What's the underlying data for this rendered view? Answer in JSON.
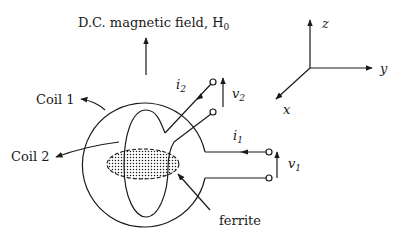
{
  "diagram": {
    "field_label": "D.C. magnetic field, H",
    "field_subscript": "0",
    "coil1_label": "Coil 1",
    "coil2_label": "Coil 2",
    "ferrite_label": "ferrite",
    "currents": {
      "i1": {
        "symbol": "i",
        "sub": "1"
      },
      "i2": {
        "symbol": "i",
        "sub": "2"
      }
    },
    "voltages": {
      "v1": {
        "symbol": "v",
        "sub": "1"
      },
      "v2": {
        "symbol": "v",
        "sub": "2"
      }
    },
    "axes": {
      "x": "x",
      "y": "y",
      "z": "z"
    },
    "colors": {
      "ink": "#1a1a1a",
      "background": "#ffffff"
    }
  }
}
